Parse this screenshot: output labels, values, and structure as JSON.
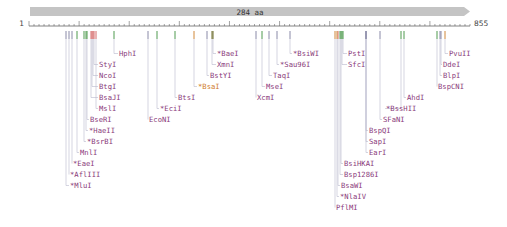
{
  "feature": {
    "label": "284 aa",
    "color": "#c4c4c4",
    "start": 1,
    "end": 855
  },
  "ruler": {
    "start_label": "1",
    "end_label": "855",
    "x0": 29,
    "x1": 470
  },
  "colors": {
    "label": "#8a3a7a",
    "line": "#b8b8cc",
    "tick_gray": "#8a8aa8",
    "tick_green": "#4f9a4f",
    "tick_red": "#d46a6a",
    "tick_orange": "#d0883a",
    "tick_olive": "#6b6b2a"
  },
  "sites": [
    {
      "name": "HphI",
      "x": 114,
      "tick": "tick_green",
      "lx": 118,
      "ly": 56
    },
    {
      "name": "StyI",
      "x": 94,
      "tick": "tick_red",
      "lx": 98,
      "ly": 67
    },
    {
      "name": "NcoI",
      "x": 93,
      "tick": "tick_red",
      "lx": 98,
      "ly": 78
    },
    {
      "name": "BtgI",
      "x": 92,
      "tick": "tick_red",
      "lx": 98,
      "ly": 89
    },
    {
      "name": "BsaJI",
      "x": 91,
      "tick": "tick_red",
      "lx": 98,
      "ly": 100
    },
    {
      "name": "MslI",
      "x": 96,
      "tick": "tick_red",
      "lx": 98,
      "ly": 111
    },
    {
      "name": "BseRI",
      "x": 87,
      "tick": "tick_green",
      "lx": 89,
      "ly": 122
    },
    {
      "name": "*HaeII",
      "x": 86,
      "tick": "tick_green",
      "lx": 88,
      "ly": 133
    },
    {
      "name": "*BsrBI",
      "x": 84,
      "tick": "tick_green",
      "lx": 86,
      "ly": 144
    },
    {
      "name": "MnlI",
      "x": 77,
      "tick": "tick_green",
      "lx": 79,
      "ly": 155
    },
    {
      "name": "*EaeI",
      "x": 72,
      "tick": "tick_gray",
      "lx": 72,
      "ly": 166
    },
    {
      "name": "*AflIII",
      "x": 69,
      "tick": "tick_gray",
      "lx": 69,
      "ly": 177
    },
    {
      "name": "*MluI",
      "x": 66,
      "tick": "tick_gray",
      "lx": 69,
      "ly": 188
    },
    {
      "name": "*BaeI",
      "x": 213,
      "tick": "tick_olive",
      "lx": 216,
      "ly": 56
    },
    {
      "name": "XmnI",
      "x": 212,
      "tick": "tick_olive",
      "lx": 216,
      "ly": 67
    },
    {
      "name": "BstYI",
      "x": 207,
      "tick": "tick_gray",
      "lx": 209,
      "ly": 78
    },
    {
      "name": "BsaI",
      "x": 194,
      "tick": "tick_orange",
      "lx": 197,
      "ly": 89,
      "star": true,
      "orange": true
    },
    {
      "name": "BtsI",
      "x": 175,
      "tick": "tick_green",
      "lx": 177,
      "ly": 100
    },
    {
      "name": "*EciI",
      "x": 157,
      "tick": "tick_green",
      "lx": 159,
      "ly": 111
    },
    {
      "name": "EcoNI",
      "x": 148,
      "tick": "tick_gray",
      "lx": 148,
      "ly": 122
    },
    {
      "name": "*BsiWI",
      "x": 290,
      "tick": "tick_gray",
      "lx": 292,
      "ly": 56
    },
    {
      "name": "*Sau96I",
      "x": 277,
      "tick": "tick_gray",
      "lx": 279,
      "ly": 67
    },
    {
      "name": "TaqI",
      "x": 269,
      "tick": "tick_gray",
      "lx": 272,
      "ly": 78
    },
    {
      "name": "MseI",
      "x": 262,
      "tick": "tick_green",
      "lx": 265,
      "ly": 89
    },
    {
      "name": "XcmI",
      "x": 256,
      "tick": "tick_gray",
      "lx": 256,
      "ly": 100
    },
    {
      "name": "PstI",
      "x": 343,
      "tick": "tick_green",
      "lx": 347,
      "ly": 56
    },
    {
      "name": "SfcI",
      "x": 342,
      "tick": "tick_green",
      "lx": 347,
      "ly": 67
    },
    {
      "name": "BspCNI",
      "x": 437,
      "tick": "tick_green",
      "lx": 437,
      "ly": 89
    },
    {
      "name": "BlpI",
      "x": 440,
      "tick": "tick_gray",
      "lx": 442,
      "ly": 78
    },
    {
      "name": "DdeI",
      "x": 441,
      "tick": "tick_gray",
      "lx": 442,
      "ly": 67
    },
    {
      "name": "PvuII",
      "x": 445,
      "tick": "tick_orange",
      "lx": 448,
      "ly": 56
    },
    {
      "name": "AhdI",
      "x": 404,
      "tick": "tick_green",
      "lx": 406,
      "ly": 100
    },
    {
      "name": "*BssHII",
      "x": 401,
      "tick": "tick_green",
      "lx": 385,
      "ly": 111
    },
    {
      "name": "SFaNI",
      "x": 380,
      "tick": "tick_gray",
      "lx": 382,
      "ly": 122
    },
    {
      "name": "BspQI",
      "x": 366,
      "tick": "tick_gray",
      "lx": 368,
      "ly": 133
    },
    {
      "name": "SapI",
      "x": 366,
      "tick": "tick_gray",
      "lx": 368,
      "ly": 144
    },
    {
      "name": "EarI",
      "x": 366,
      "tick": "tick_gray",
      "lx": 368,
      "ly": 155
    },
    {
      "name": "BsiHKAI",
      "x": 341,
      "tick": "tick_green",
      "lx": 343,
      "ly": 166
    },
    {
      "name": "Bsp1286I",
      "x": 340,
      "tick": "tick_green",
      "lx": 343,
      "ly": 177
    },
    {
      "name": "BsaWI",
      "x": 338,
      "tick": "tick_red",
      "lx": 340,
      "ly": 188
    },
    {
      "name": "*NlaIV",
      "x": 337,
      "tick": "tick_orange",
      "lx": 339,
      "ly": 199
    },
    {
      "name": "PflMI",
      "x": 335,
      "tick": "tick_orange",
      "lx": 335,
      "ly": 210
    }
  ]
}
